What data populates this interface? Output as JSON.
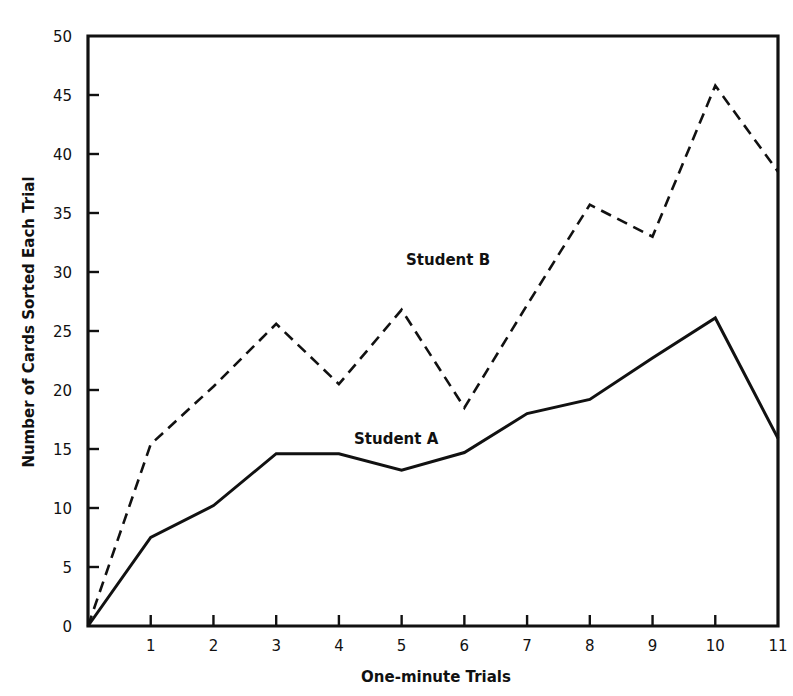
{
  "chart_data": {
    "type": "line",
    "title": "",
    "xlabel": "One-minute Trials",
    "ylabel": "Number of Cards Sorted Each Trial",
    "x": [
      0,
      1,
      2,
      3,
      4,
      5,
      6,
      7,
      8,
      9,
      10,
      11
    ],
    "x_tick_labels": [
      "1",
      "2",
      "3",
      "4",
      "5",
      "6",
      "7",
      "8",
      "9",
      "10",
      "11"
    ],
    "y_tick_labels": [
      "0",
      "5",
      "10",
      "15",
      "20",
      "25",
      "30",
      "35",
      "40",
      "45",
      "50"
    ],
    "xlim": [
      0,
      11
    ],
    "ylim": [
      0,
      50
    ],
    "grid": false,
    "legend_position": "inline labels",
    "series": [
      {
        "name": "Student A",
        "style": "solid",
        "color": "#111111",
        "values": [
          0,
          7.5,
          10.2,
          14.6,
          14.6,
          13.2,
          14.7,
          18.0,
          19.2,
          22.7,
          26.1,
          15.9
        ]
      },
      {
        "name": "Student B",
        "style": "dashed",
        "color": "#111111",
        "values": [
          0,
          15.4,
          20.3,
          25.6,
          20.5,
          26.8,
          18.5,
          27.2,
          35.7,
          33.0,
          45.8,
          38.5
        ]
      }
    ],
    "annotations": [
      {
        "text": "Student B",
        "x": 5.5,
        "y": 30.5
      },
      {
        "text": "Student A",
        "x": 4.4,
        "y": 15.5
      }
    ]
  },
  "labels": {
    "x_axis_title": "One-minute Trials",
    "y_axis_title": "Number of Cards Sorted Each Trial",
    "series_a_label": "Student A",
    "series_b_label": "Student B"
  }
}
